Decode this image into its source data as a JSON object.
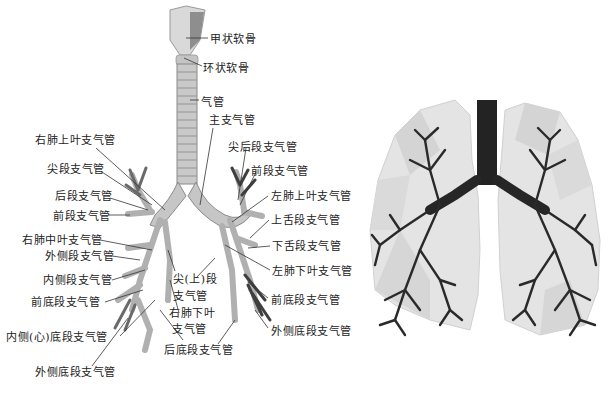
{
  "diagram": {
    "left_panel": {
      "name": "bronchial-tree-diagram",
      "labels": [
        {
          "id": "thyroid-cartilage",
          "text": "甲状软骨",
          "x": 210,
          "y": 33
        },
        {
          "id": "cricoid-cartilage",
          "text": "环状软骨",
          "x": 203,
          "y": 62
        },
        {
          "id": "trachea",
          "text": "气管",
          "x": 201,
          "y": 96
        },
        {
          "id": "main-bronchus",
          "text": "主支气管",
          "x": 209,
          "y": 114
        },
        {
          "id": "right-upper-lobe-bronchus",
          "text": "右肺上叶支气管",
          "x": 35,
          "y": 134
        },
        {
          "id": "apical-segment-bronchus",
          "text": "尖段支气管",
          "x": 47,
          "y": 163
        },
        {
          "id": "apicoposterior-segment-bronchus",
          "text": "尖后段支气管",
          "x": 228,
          "y": 141
        },
        {
          "id": "left-anterior-segment-bronchus",
          "text": "前段支气管",
          "x": 251,
          "y": 165
        },
        {
          "id": "posterior-segment-bronchus",
          "text": "后段支气管",
          "x": 55,
          "y": 190
        },
        {
          "id": "left-upper-lobe-bronchus",
          "text": "左肺上叶支气管",
          "x": 271,
          "y": 190
        },
        {
          "id": "anterior-segment-bronchus",
          "text": "前段支气管",
          "x": 53,
          "y": 210
        },
        {
          "id": "superior-lingular-bronchus",
          "text": "上舌段支气管",
          "x": 271,
          "y": 214
        },
        {
          "id": "right-middle-lobe-bronchus",
          "text": "右肺中叶支气管",
          "x": 22,
          "y": 234
        },
        {
          "id": "lateral-segment-bronchus",
          "text": "外侧段支气管",
          "x": 45,
          "y": 250
        },
        {
          "id": "inferior-lingular-bronchus",
          "text": "下舌段支气管",
          "x": 272,
          "y": 240
        },
        {
          "id": "left-lower-lobe-bronchus",
          "text": "左肺下叶支气管",
          "x": 272,
          "y": 265
        },
        {
          "id": "medial-segment-bronchus",
          "text": "内侧段支气管",
          "x": 43,
          "y": 274
        },
        {
          "id": "superior-segment-bronchus-line1",
          "text": "尖(上)段",
          "x": 173,
          "y": 273
        },
        {
          "id": "superior-segment-bronchus-line2",
          "text": "支气管",
          "x": 173,
          "y": 290
        },
        {
          "id": "right-anterior-basal-bronchus",
          "text": "前底段支气管",
          "x": 31,
          "y": 296
        },
        {
          "id": "left-anterior-basal-bronchus",
          "text": "前底段支气管",
          "x": 271,
          "y": 294
        },
        {
          "id": "right-lower-lobe-bronchus-line1",
          "text": "右肺下叶",
          "x": 169,
          "y": 307
        },
        {
          "id": "right-lower-lobe-bronchus-line2",
          "text": "支气管",
          "x": 172,
          "y": 323
        },
        {
          "id": "left-lateral-basal-bronchus",
          "text": "外侧底段支气管",
          "x": 271,
          "y": 325
        },
        {
          "id": "medial-cardiac-basal-bronchus",
          "text": "内侧(心)底段支气管",
          "x": 6,
          "y": 331
        },
        {
          "id": "posterior-basal-bronchus",
          "text": "后底段支气管",
          "x": 164,
          "y": 344
        },
        {
          "id": "right-lateral-basal-bronchus",
          "text": "外侧底段支气管",
          "x": 35,
          "y": 366
        }
      ]
    },
    "right_panel": {
      "name": "low-poly-lungs-illustration",
      "colors": {
        "lung_fill": "#e4e4e4",
        "lung_shade": "#cfcfcf",
        "bronchi": "#2a2a2a",
        "trachea": "#1e1e1e"
      }
    },
    "colors": {
      "background": "#ffffff",
      "text": "#222222",
      "leader_line": "#333333",
      "airway": "#bdbdbd",
      "airway_dark": "#8a8a8a"
    }
  }
}
